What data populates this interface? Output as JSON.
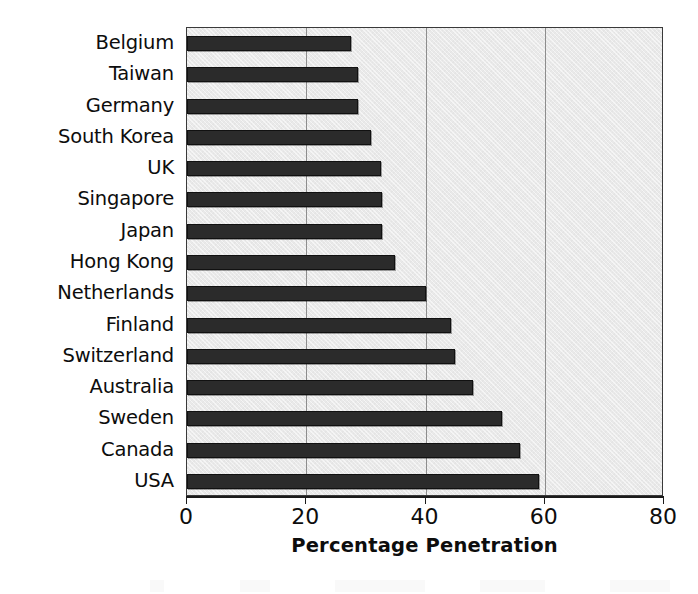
{
  "chart_data": {
    "type": "bar",
    "orientation": "horizontal",
    "title": "",
    "xlabel": "Percentage Penetration",
    "ylabel": "",
    "xlim": [
      0,
      80
    ],
    "xticks": [
      0,
      20,
      40,
      60,
      80
    ],
    "xtick_labels": [
      "0",
      "20",
      "40",
      "60",
      "80"
    ],
    "grid": true,
    "grid_axis": "x",
    "legend": null,
    "categories": [
      "Belgium",
      "Taiwan",
      "Germany",
      "South Korea",
      "UK",
      "Singapore",
      "Japan",
      "Hong Kong",
      "Netherlands",
      "Finland",
      "Switzerland",
      "Australia",
      "Sweden",
      "Canada",
      "USA"
    ],
    "values": [
      27.5,
      28.7,
      28.7,
      30.9,
      32.5,
      32.7,
      32.7,
      34.9,
      40.1,
      44.3,
      45.0,
      48.0,
      52.9,
      55.8,
      59.0
    ],
    "colors": {
      "bar_fill": "#2b2b2b",
      "bar_border": "#111111",
      "plot_background": "#e9e9e9",
      "gridline": "#8d8d8d",
      "axis": "#1b1b1b",
      "text": "#0d0d0d",
      "figure_background": "#ffffff"
    }
  },
  "axis": {
    "x_title": "Percentage Penetration"
  }
}
